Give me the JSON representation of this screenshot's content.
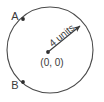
{
  "figure": {
    "type": "geometry-diagram",
    "background_color": "#ffffff",
    "stroke_color": "#4a4a4a",
    "text_color": "#3a3a3a",
    "circle": {
      "center_label": "(0, 0)",
      "radius_value": "4",
      "radius_unit": "units",
      "radius_label": "4 units",
      "center_x": 50,
      "center_y": 50,
      "radius_px": 43
    },
    "points": [
      {
        "label": "A",
        "label_x": 15,
        "label_y": 20,
        "dot_x": 23,
        "dot_y": 19
      },
      {
        "label": "B",
        "label_x": 15,
        "label_y": 89,
        "dot_x": 23,
        "dot_y": 82
      }
    ],
    "radius_arrow": {
      "from_x": 48,
      "from_y": 52,
      "to_x": 82,
      "to_y": 24,
      "label_rotation_deg": -39
    }
  }
}
